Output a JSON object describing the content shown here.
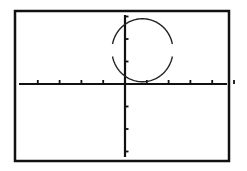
{
  "chart_data": {
    "type": "line",
    "title": "",
    "xlabel": "",
    "ylabel": "",
    "xlim": [
      -4,
      5
    ],
    "ylim": [
      -3,
      3
    ],
    "grid": false,
    "x_ticks": [
      -4,
      -3,
      -2,
      -1,
      1,
      2,
      3,
      4,
      5
    ],
    "y_ticks": [
      -3,
      -2,
      -1,
      1,
      2,
      3
    ],
    "series": [
      {
        "name": "circle",
        "shape": "circle",
        "center": [
          0.8,
          1.5
        ],
        "radius": 1.4,
        "color": "#222222"
      }
    ]
  },
  "colors": {
    "frame": "#111111",
    "axis": "#111111",
    "curve": "#222222",
    "background": "#ffffff"
  }
}
